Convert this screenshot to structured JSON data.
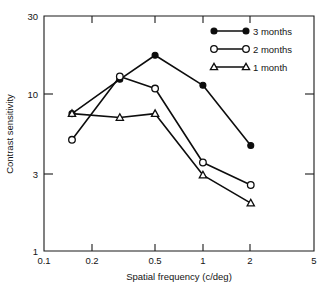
{
  "chart_data": {
    "type": "line",
    "title": "",
    "xlabel": "Spatial frequency (c/deg)",
    "ylabel": "Contrast sensitivity",
    "xscale": "log",
    "yscale": "log",
    "xlim": [
      0.1,
      5
    ],
    "ylim": [
      1,
      30
    ],
    "grid": false,
    "legend_position": "top-right",
    "xticks": [
      0.1,
      0.2,
      0.5,
      1,
      2,
      5
    ],
    "xtick_labels": [
      "0.1",
      "0.2",
      "0.5",
      "1",
      "2",
      "5"
    ],
    "yticks": [
      1,
      3,
      10,
      30
    ],
    "ytick_labels": [
      "1",
      "3",
      "10",
      "30"
    ],
    "x": [
      0.15,
      0.3,
      0.5,
      1.0,
      2.0
    ],
    "series": [
      {
        "name": "3 months",
        "marker": "filled-circle",
        "values": [
          7.3,
          12.0,
          17.0,
          11.0,
          4.6
        ]
      },
      {
        "name": "2 months",
        "marker": "open-circle",
        "values": [
          5.0,
          12.5,
          10.5,
          3.6,
          2.6
        ]
      },
      {
        "name": "1 month",
        "marker": "open-triangle",
        "values": [
          7.3,
          6.9,
          7.3,
          3.0,
          2.0
        ]
      }
    ]
  },
  "axes": {
    "x_title": "Spatial frequency (c/deg)",
    "y_title": "Contrast sensitivity",
    "x_tick_labels": [
      "0.1",
      "0.2",
      "0.5",
      "1",
      "2",
      "5"
    ],
    "y_tick_labels": [
      "30",
      "10",
      "3",
      "1"
    ]
  },
  "legend": {
    "entries": [
      {
        "label": "3 months"
      },
      {
        "label": "2 months"
      },
      {
        "label": "1 month"
      }
    ]
  },
  "colors": {
    "ink": "#0d0d0d",
    "background": "#ffffff"
  }
}
